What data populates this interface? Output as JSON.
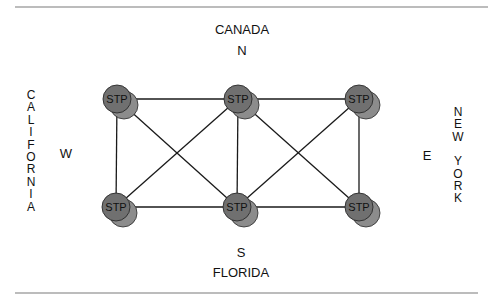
{
  "diagram": {
    "rules": {
      "top": {
        "x1": 15,
        "x2": 488,
        "y": 7
      },
      "bottom": {
        "x1": 15,
        "x2": 478,
        "y": 293
      },
      "color": "#7a7a7a"
    },
    "labels": {
      "north_region": "CANADA",
      "north": "N",
      "south": "S",
      "south_region": "FLORIDA",
      "west": "W",
      "east": "E",
      "west_region": [
        "C",
        "A",
        "L",
        "I",
        "F",
        "O",
        "R",
        "N",
        "I",
        "A"
      ],
      "east_region": [
        "N",
        "E",
        "W",
        "",
        "Y",
        "O",
        "R",
        "K"
      ]
    },
    "colors": {
      "node_fill": "#707070",
      "node_shadow": "#8c8c8c",
      "node_stroke": "#2a2a2a",
      "edge": "#1a1a1a"
    },
    "nodes": [
      {
        "id": "tl",
        "label": "STP",
        "x": 117,
        "y": 99
      },
      {
        "id": "tm",
        "label": "STP",
        "x": 238,
        "y": 99
      },
      {
        "id": "tr",
        "label": "STP",
        "x": 359,
        "y": 99
      },
      {
        "id": "bl",
        "label": "STP",
        "x": 116,
        "y": 207
      },
      {
        "id": "bm",
        "label": "STP",
        "x": 237,
        "y": 207
      },
      {
        "id": "br",
        "label": "STP",
        "x": 359,
        "y": 207
      }
    ],
    "edges": [
      [
        "tl",
        "tm"
      ],
      [
        "tm",
        "tr"
      ],
      [
        "bl",
        "bm"
      ],
      [
        "bm",
        "br"
      ],
      [
        "tl",
        "bl"
      ],
      [
        "tm",
        "bm"
      ],
      [
        "tr",
        "br"
      ],
      [
        "tl",
        "bm"
      ],
      [
        "tm",
        "bl"
      ],
      [
        "tm",
        "br"
      ],
      [
        "tr",
        "bm"
      ]
    ]
  }
}
